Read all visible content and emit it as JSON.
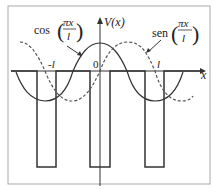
{
  "diagram": {
    "axes": {
      "y_label": "V(x)",
      "x_label": "x",
      "origin_label": "0",
      "tick_labels": [
        "-l",
        "l"
      ]
    },
    "curves": [
      {
        "name": "cos",
        "label_fn": "cos",
        "label_num": "πx",
        "label_den": "l",
        "style": "solid"
      },
      {
        "name": "sen",
        "label_fn": "sen",
        "label_num": "πx",
        "label_den": "l",
        "style": "dashed"
      }
    ],
    "wells": 3,
    "colors": {
      "line": "#333333",
      "frame": "#999999",
      "background": "#ffffff"
    }
  }
}
